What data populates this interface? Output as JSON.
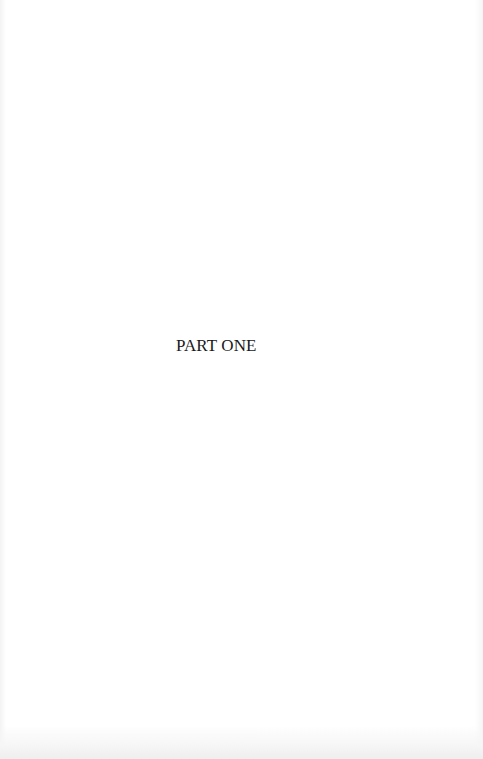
{
  "document": {
    "type": "book-page",
    "part_heading": "PART ONE"
  },
  "colors": {
    "page_background": "#ffffff",
    "text": "#1a1a1a"
  }
}
